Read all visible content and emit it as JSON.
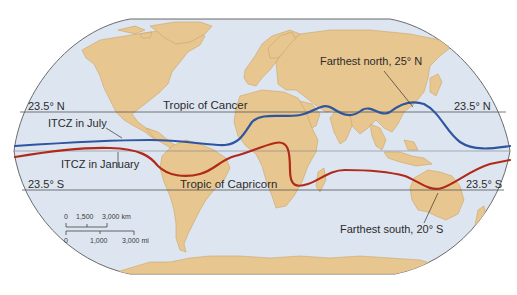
{
  "map": {
    "projection": "Robinson-style world map",
    "colors": {
      "ocean": "#dde5f0",
      "land": "#e8c68f",
      "land_edge": "#c9a66a",
      "border": "#555555",
      "latitude_lines": "#555555",
      "itcz_july": "#2e55a0",
      "itcz_january": "#b02a1a",
      "leader_lines": "#333333"
    }
  },
  "latitude_lines": {
    "north": {
      "label_left": "23.5° N",
      "label_right": "23.5° N",
      "name": "Tropic of Cancer"
    },
    "equator": {
      "label": ""
    },
    "south": {
      "label_left": "23.5° S",
      "label_right": "23.5° S",
      "name": "Tropic of Capricorn"
    }
  },
  "itcz": {
    "july": {
      "label": "ITCZ in July"
    },
    "january": {
      "label": "ITCZ in January"
    }
  },
  "annotations": {
    "farthest_north": "Farthest north, 25° N",
    "farthest_south": "Farthest south, 20° S"
  },
  "scale_bar": {
    "km": {
      "ticks": [
        "0",
        "1,500",
        "3,000 km"
      ]
    },
    "mi": {
      "ticks": [
        "0",
        "1,000",
        "3,000 mi"
      ]
    }
  }
}
